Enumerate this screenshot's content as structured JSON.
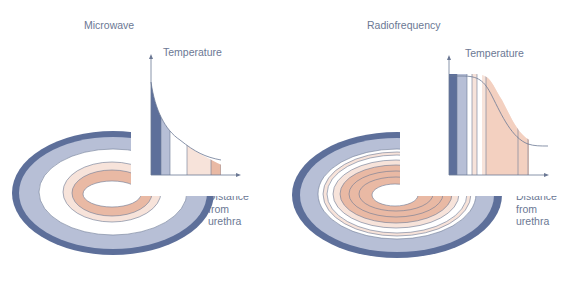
{
  "panels": [
    {
      "title": "Microwave",
      "y_axis_label": "Temperature",
      "x_axis_label_lines": [
        "Distance",
        "from",
        "urethra"
      ],
      "profile": "exponential decay — steep near urethra, low far"
    },
    {
      "title": "Radiofrequency",
      "y_axis_label": "Temperature",
      "x_axis_label_lines": [
        "Distance",
        "from",
        "urethra"
      ],
      "profile": "plateau near urethra then sigmoid fall-off"
    }
  ],
  "colors": {
    "dark_blue": "#5d6f9a",
    "light_blue": "#b7bfd6",
    "white": "#ffffff",
    "light_pink": "#f7e3da",
    "salmon": "#e9b9a4",
    "text": "#6b7894",
    "axis": "#6b7894"
  }
}
